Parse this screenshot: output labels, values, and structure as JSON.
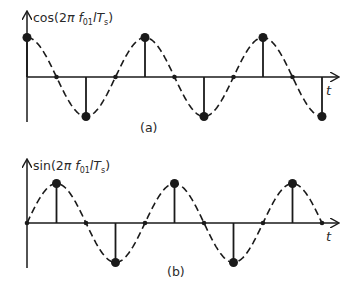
{
  "panels": [
    {
      "id": "a",
      "y_label_prefix": "cos(2",
      "y_label_pi": "π",
      "y_label_f": " f",
      "y_label_sub": "01",
      "y_label_mid": "l",
      "y_label_T": "T",
      "y_label_sub2": "s",
      "y_label_suffix": ")",
      "x_label": "t",
      "caption": "(a)",
      "function": "cos",
      "samples": [
        1,
        0,
        -1,
        0,
        1,
        0,
        -1,
        0,
        1,
        0,
        -1
      ]
    },
    {
      "id": "b",
      "y_label_prefix": "sin(2",
      "y_label_pi": "π",
      "y_label_f": " f",
      "y_label_sub": "01",
      "y_label_mid": "l",
      "y_label_T": "T",
      "y_label_sub2": "s",
      "y_label_suffix": ")",
      "x_label": "t",
      "caption": "(b)",
      "function": "sin",
      "samples": [
        0,
        1,
        0,
        -1,
        0,
        1,
        0,
        -1,
        0,
        1,
        0
      ]
    }
  ],
  "colors": {
    "stroke": "#1a1a1a",
    "text": "#2a2a2a"
  }
}
